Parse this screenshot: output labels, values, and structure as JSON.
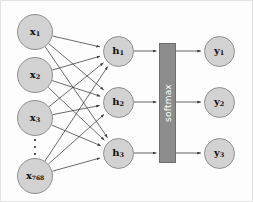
{
  "diagram": {
    "colors": {
      "node_fill": "#d2d2d2",
      "node_stroke": "#8f8f8f",
      "softmax_fill": "#8c8c8c",
      "softmax_stroke": "#6f6f6f",
      "softmax_text": "#ffffff",
      "edge": "#3a3a3a",
      "label_text": "#111111",
      "frame": "#e2e2e2"
    },
    "input_layer": {
      "name": "input-layer",
      "nodes": [
        {
          "id": "x1",
          "base": "x",
          "sub": "1",
          "cx": 34,
          "cy": 31
        },
        {
          "id": "x2",
          "base": "x",
          "sub": "2",
          "cx": 34,
          "cy": 74
        },
        {
          "id": "x3",
          "base": "x",
          "sub": "3",
          "cx": 34,
          "cy": 117
        },
        {
          "id": "x768",
          "base": "x",
          "sub": "768",
          "cx": 34,
          "cy": 175
        }
      ],
      "ellipsis": {
        "name": "input-ellipsis",
        "cx": 34,
        "cy": 146,
        "dots": 3
      }
    },
    "hidden_layer": {
      "name": "hidden-layer",
      "nodes": [
        {
          "id": "h1",
          "base": "h",
          "sub": "1",
          "cx": 117,
          "cy": 50
        },
        {
          "id": "h2",
          "base": "h",
          "sub": "2",
          "cx": 117,
          "cy": 101
        },
        {
          "id": "h3",
          "base": "h",
          "sub": "3",
          "cx": 117,
          "cy": 152
        }
      ]
    },
    "softmax": {
      "name": "softmax-block",
      "label": "softmax",
      "x": 158,
      "y": 42,
      "width": 17,
      "height": 120
    },
    "output_layer": {
      "name": "output-layer",
      "nodes": [
        {
          "id": "y1",
          "base": "y",
          "sub": "1",
          "cx": 218,
          "cy": 50
        },
        {
          "id": "y2",
          "base": "y",
          "sub": "2",
          "cx": 218,
          "cy": 101
        },
        {
          "id": "y3",
          "base": "y",
          "sub": "3",
          "cx": 218,
          "cy": 152
        }
      ]
    },
    "edges": {
      "input_to_hidden_count": 12,
      "hidden_to_softmax_count": 3,
      "softmax_to_output_count": 3,
      "fully_connected": true
    }
  }
}
